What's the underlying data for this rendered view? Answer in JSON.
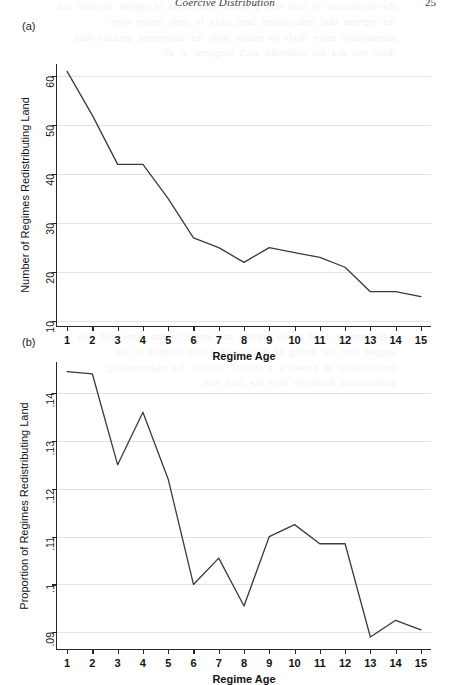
{
  "running_head": {
    "title": "Coercive Distribution",
    "page_number": "25"
  },
  "ghost_text": {
    "block_a": "the distribution of land was a central instrument of regime survival and the regimes that redistributed land early in their tenure were substantially more likely to endure over the subsequent decades than those that did not undertake such programs at all",
    "block_b": "these patterns hold across regions and across regime types and they suggest that the timing of distributive policy relative to the consolidation of power is a critical variable for understanding authoritarian durability over the long run"
  },
  "panels": [
    {
      "tag": "(a)",
      "chart_key": "chart_a"
    },
    {
      "tag": "(b)",
      "chart_key": "chart_b"
    }
  ],
  "chart_data": [
    {
      "id": "chart_a",
      "type": "line",
      "title": "",
      "panel_label": "(a)",
      "xlabel": "Regime Age",
      "ylabel": "Number of Regimes Redistributing Land",
      "x": [
        1,
        2,
        3,
        4,
        5,
        6,
        7,
        8,
        9,
        10,
        11,
        12,
        13,
        14,
        15
      ],
      "categories": [
        "1",
        "2",
        "3",
        "4",
        "5",
        "6",
        "7",
        "8",
        "9",
        "10",
        "11",
        "12",
        "13",
        "14",
        "15"
      ],
      "values": [
        61,
        52,
        42,
        42,
        35,
        27,
        25,
        22,
        25,
        24,
        23,
        21,
        16,
        16,
        15
      ],
      "xlim": [
        0.6,
        15.4
      ],
      "ylim": [
        9,
        62.5
      ],
      "yticks": [
        10,
        20,
        30,
        40,
        50,
        60
      ],
      "ytick_labels": [
        "10",
        "20",
        "30",
        "40",
        "50",
        "60"
      ],
      "xticks": [
        1,
        2,
        3,
        4,
        5,
        6,
        7,
        8,
        9,
        10,
        11,
        12,
        13,
        14,
        15
      ],
      "grid": "horizontal",
      "legend": "none",
      "line_color": "#3a3a3a"
    },
    {
      "id": "chart_b",
      "type": "line",
      "title": "",
      "panel_label": "(b)",
      "xlabel": "Regime Age",
      "ylabel": "Proportion of Regimes Redistributing Land",
      "x": [
        1,
        2,
        3,
        4,
        5,
        6,
        7,
        8,
        9,
        10,
        11,
        12,
        13,
        14,
        15
      ],
      "categories": [
        "1",
        "2",
        "3",
        "4",
        "5",
        "6",
        "7",
        "8",
        "9",
        "10",
        "11",
        "12",
        "13",
        "14",
        "15"
      ],
      "values": [
        0.1445,
        0.144,
        0.125,
        0.136,
        0.122,
        0.1,
        0.1055,
        0.0955,
        0.11,
        0.1125,
        0.1085,
        0.1085,
        0.089,
        0.0925,
        0.0905
      ],
      "xlim": [
        0.6,
        15.4
      ],
      "ylim": [
        0.0865,
        0.1465
      ],
      "yticks": [
        0.09,
        0.1,
        0.11,
        0.12,
        0.13,
        0.14
      ],
      "ytick_labels": [
        ".09",
        ".1",
        ".11",
        ".12",
        ".13",
        ".14"
      ],
      "xticks": [
        1,
        2,
        3,
        4,
        5,
        6,
        7,
        8,
        9,
        10,
        11,
        12,
        13,
        14,
        15
      ],
      "grid": "horizontal",
      "legend": "none",
      "line_color": "#3a3a3a"
    }
  ]
}
